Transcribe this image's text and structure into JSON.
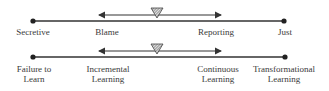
{
  "scales": [
    {
      "id": "culture",
      "endpoints": {
        "left": "Secretive",
        "right": "Just"
      },
      "range": {
        "left": "Blame",
        "right": "Reporting"
      }
    },
    {
      "id": "learning",
      "endpoints": {
        "left": "Failure to\nLearn",
        "right": "Transformational\nLearning"
      },
      "range": {
        "left": "Incremental\nLearning",
        "right": "Continuous\nLearning"
      }
    }
  ]
}
